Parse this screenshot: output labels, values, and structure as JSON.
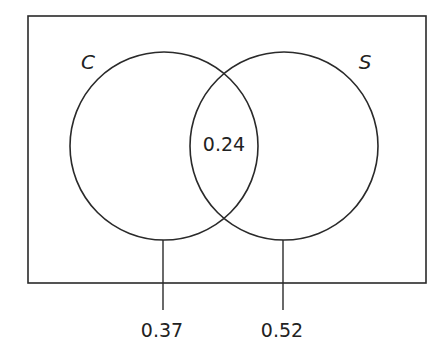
{
  "diagram": {
    "type": "venn",
    "sets": [
      {
        "name": "C",
        "label": "C"
      },
      {
        "name": "S",
        "label": "S"
      }
    ],
    "intersection_value": "0.24",
    "callouts": [
      {
        "target": "C",
        "value": "0.37"
      },
      {
        "target": "S",
        "value": "0.52"
      }
    ],
    "stroke_color": "#2a2a2a",
    "background": "#ffffff"
  }
}
